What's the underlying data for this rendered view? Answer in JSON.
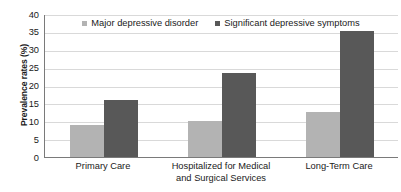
{
  "chart_data": {
    "type": "bar",
    "title": "",
    "xlabel": "",
    "ylabel": "Prevalence rates (%)",
    "ylim": [
      0,
      40
    ],
    "ytick_step": 5,
    "yticks": [
      40,
      35,
      30,
      25,
      20,
      15,
      10,
      5,
      0
    ],
    "grid": true,
    "legend_position": "top-center",
    "categories": [
      [
        "Primary Care"
      ],
      [
        "Hospitalized for Medical",
        "and Surgical Services"
      ],
      [
        "Long-Term Care"
      ]
    ],
    "series": [
      {
        "name": "Major depressive disorder",
        "color": "#b3b3b3",
        "values": [
          9,
          10,
          12.5
        ]
      },
      {
        "name": "Significant depressive symptoms",
        "color": "#585858",
        "values": [
          16,
          23.5,
          35.3
        ]
      }
    ]
  },
  "axis": {
    "y_title": "Prevalence rates (%)"
  },
  "colors": {
    "series_a": "#b3b3b3",
    "series_b": "#585858",
    "gridline": "#d9d9d9",
    "axis_line": "#7a7a7a",
    "text": "#1a1a1a",
    "background": "#ffffff"
  }
}
